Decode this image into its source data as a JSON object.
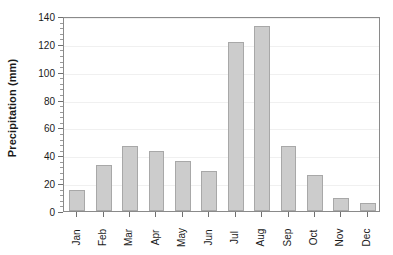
{
  "chart_data": {
    "type": "bar",
    "title": "",
    "subtitle": "",
    "xlabel": "",
    "ylabel": "Precipitation (mm)",
    "categories": [
      "Jan",
      "Feb",
      "Mar",
      "Apr",
      "May",
      "Jun",
      "Jul",
      "Aug",
      "Sep",
      "Oct",
      "Nov",
      "Dec"
    ],
    "values": [
      15,
      33,
      47,
      43,
      36,
      29,
      121,
      133,
      47,
      26,
      9,
      6
    ],
    "ylim": [
      0,
      140
    ],
    "ytick_step": 20,
    "ytick_labels": [
      "0",
      "20",
      "40",
      "60",
      "80",
      "100",
      "120",
      "140"
    ],
    "yminor_step": 4,
    "grid": "horizontal",
    "legend": "none",
    "bar_fill": "#cccccc",
    "bar_border": "#a8a8a8",
    "axis_color": "#8a8a8a",
    "grid_color": "#f0f0f0",
    "background": "#ffffff",
    "annotations": []
  }
}
